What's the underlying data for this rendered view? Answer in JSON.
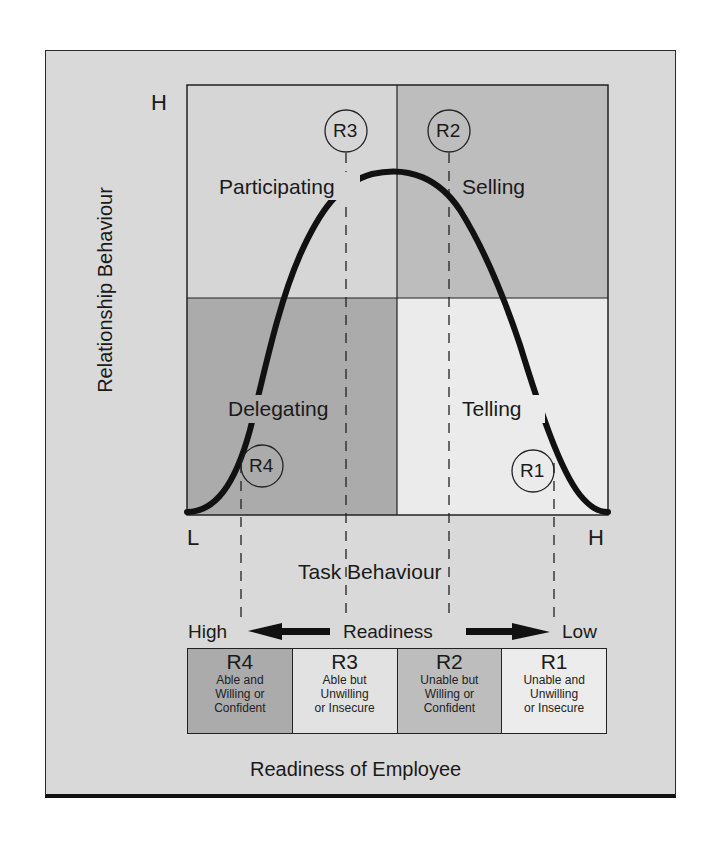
{
  "diagram": {
    "y_axis": {
      "label": "Relationship Behaviour",
      "high": "H"
    },
    "x_axis": {
      "label": "Task Behaviour",
      "low": "L",
      "high": "H"
    },
    "quadrants": [
      {
        "id": "S3",
        "label": "Participating",
        "position": "top-left",
        "color": "#d6d6d6"
      },
      {
        "id": "S2",
        "label": "Selling",
        "position": "top-right",
        "color": "#bdbdbd"
      },
      {
        "id": "S4",
        "label": "Delegating",
        "position": "bottom-left",
        "color": "#ababab"
      },
      {
        "id": "S1",
        "label": "Telling",
        "position": "bottom-right",
        "color": "#ebebeb"
      }
    ],
    "markers": [
      {
        "label": "R3",
        "quadrant": "Participating"
      },
      {
        "label": "R2",
        "quadrant": "Selling"
      },
      {
        "label": "R4",
        "quadrant": "Delegating"
      },
      {
        "label": "R1",
        "quadrant": "Telling"
      }
    ],
    "readiness_scale": {
      "left": "High",
      "center": "Readiness",
      "right": "Low"
    },
    "readiness_levels": [
      {
        "code": "R4",
        "desc": [
          "Able and",
          "Willing or",
          "Confident"
        ],
        "color": "#ababab"
      },
      {
        "code": "R3",
        "desc": [
          "Able but",
          "Unwilling",
          "or Insecure"
        ],
        "color": "#e2e2e2"
      },
      {
        "code": "R2",
        "desc": [
          "Unable but",
          "Willing or",
          "Confident"
        ],
        "color": "#bdbdbd"
      },
      {
        "code": "R1",
        "desc": [
          "Unable and",
          "Unwilling",
          "or Insecure"
        ],
        "color": "#ececec"
      }
    ],
    "footer": "Readiness of Employee"
  },
  "colors": {
    "frame_bg": "#d9d9d9",
    "line": "#111111"
  }
}
